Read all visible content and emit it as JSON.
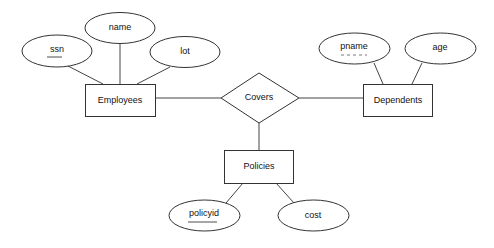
{
  "diagram": {
    "type": "er-diagram",
    "entities": [
      {
        "id": "employees",
        "label": "Employees"
      },
      {
        "id": "dependents",
        "label": "Dependents",
        "weak": false
      },
      {
        "id": "policies",
        "label": "Policies"
      }
    ],
    "relationships": [
      {
        "id": "covers",
        "label": "Covers",
        "connects": [
          "Employees",
          "Dependents",
          "Policies"
        ]
      }
    ],
    "attributes": [
      {
        "id": "ssn",
        "label": "ssn",
        "of": "Employees",
        "key": true
      },
      {
        "id": "name",
        "label": "name",
        "of": "Employees",
        "key": false
      },
      {
        "id": "lot",
        "label": "lot",
        "of": "Employees",
        "key": false
      },
      {
        "id": "pname",
        "label": "pname",
        "of": "Dependents",
        "partial_key": true
      },
      {
        "id": "age",
        "label": "age",
        "of": "Dependents",
        "key": false
      },
      {
        "id": "policyid",
        "label": "policyid",
        "of": "Policies",
        "key": true
      },
      {
        "id": "cost",
        "label": "cost",
        "of": "Policies",
        "key": false
      }
    ]
  }
}
